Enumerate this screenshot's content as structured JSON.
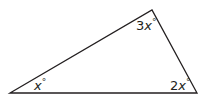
{
  "figure": {
    "type": "triangle",
    "stroke_color": "#231f20",
    "angles": {
      "left": {
        "coef": "",
        "var": "x",
        "unit": "°"
      },
      "top": {
        "coef": "3",
        "var": "x",
        "unit": "°"
      },
      "right": {
        "coef": "2",
        "var": "x",
        "unit": "°"
      }
    }
  }
}
